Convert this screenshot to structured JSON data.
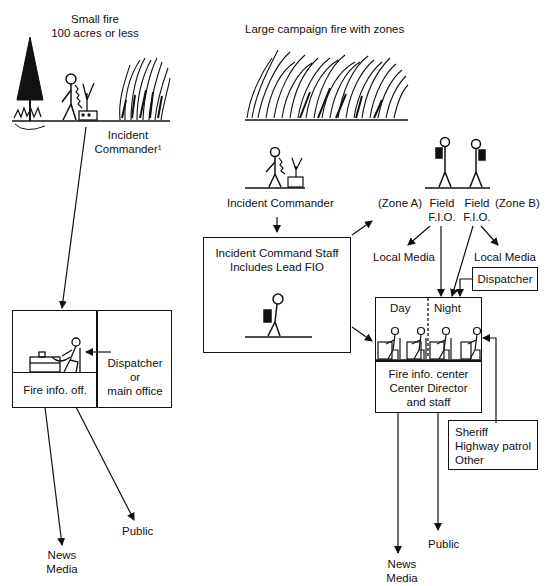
{
  "small_fire": {
    "title_line1": "Small fire",
    "title_line2": "100 acres or less",
    "commander_line1": "Incident",
    "commander_line2": "Commander¹",
    "office_label": "Fire info. off.",
    "dispatcher_line1": "Dispatcher",
    "dispatcher_line2": "or",
    "dispatcher_line3": "main office",
    "public": "Public",
    "news_line1": "News",
    "news_line2": "Media"
  },
  "large_fire": {
    "title": "Large campaign fire with zones",
    "commander": "Incident Commander",
    "staff_line1": "Incident Command Staff",
    "staff_line2": "Includes Lead FIO",
    "zone_a": "(Zone A)",
    "zone_b": "(Zone B)",
    "field_a_line1": "Field",
    "field_a_line2": "F.I.O.",
    "field_b_line1": "Field",
    "field_b_line2": "F.I.O.",
    "local_media_a": "Local Media",
    "local_media_b": "Local Media",
    "dispatcher": "Dispatcher",
    "day": "Day",
    "night": "Night",
    "center_line1": "Fire info. center",
    "center_line2": "Center Director",
    "center_line3": "and staff",
    "agencies_line1": "Sheriff",
    "agencies_line2": "Highway patrol",
    "agencies_line3": "Other",
    "public": "Public",
    "news_line1": "News",
    "news_line2": "Media"
  }
}
